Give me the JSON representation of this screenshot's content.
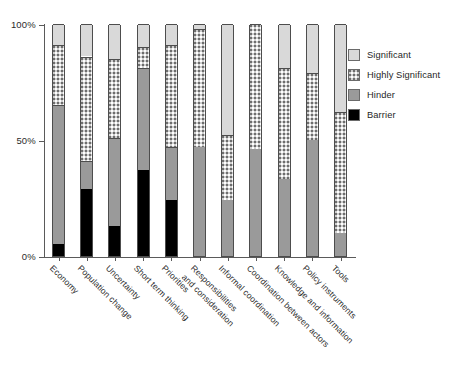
{
  "chart_data": {
    "type": "bar",
    "subtype": "stacked-100-percent",
    "title": "",
    "xlabel": "",
    "ylabel": "",
    "ylim": [
      0,
      100
    ],
    "ytick_labels": [
      "100%",
      "50%",
      "0%"
    ],
    "ytick_values": [
      100,
      50,
      0
    ],
    "grid": false,
    "legend_position": "right",
    "legend": [
      "Significant",
      "Highly Significant",
      "Hinder",
      "Barrier"
    ],
    "stack_order_bottom_to_top": [
      "Barrier",
      "Hinder",
      "Highly Significant",
      "Significant"
    ],
    "categories": [
      "Economy",
      "Population change",
      "Uncertainty",
      "Short term thinking",
      "Priorities",
      "Responsibilities and consideration",
      "Informal coordination",
      "Coordination between actors",
      "Knowledge and information",
      "Policy instruments",
      "Tools"
    ],
    "series": [
      {
        "name": "Barrier",
        "values": [
          5,
          29,
          13,
          37,
          24,
          0,
          0,
          0,
          0,
          0,
          0
        ]
      },
      {
        "name": "Hinder",
        "values": [
          60,
          12,
          38,
          44,
          23,
          47,
          24,
          46,
          33,
          50,
          10
        ]
      },
      {
        "name": "Highly Significant",
        "values": [
          26,
          45,
          34,
          9,
          44,
          51,
          28,
          54,
          48,
          29,
          52
        ]
      },
      {
        "name": "Significant",
        "values": [
          9,
          14,
          15,
          10,
          9,
          2,
          48,
          0,
          19,
          21,
          38
        ]
      }
    ]
  },
  "legend": {
    "items": [
      {
        "label": "Significant",
        "pattern": "solid-light",
        "color": "#d9d9d9"
      },
      {
        "label": "Highly Significant",
        "pattern": "stipple",
        "color": "#cfcfcf"
      },
      {
        "label": "Hinder",
        "pattern": "solid-medium",
        "color": "#9a9a9a"
      },
      {
        "label": "Barrier",
        "pattern": "solid-black",
        "color": "#000000"
      }
    ]
  },
  "axis": {
    "y_labels": [
      "100%",
      "50%",
      "0%"
    ]
  },
  "x_labels": [
    {
      "line1": "Economy",
      "line2": ""
    },
    {
      "line1": "Population change",
      "line2": ""
    },
    {
      "line1": "Uncertainty",
      "line2": ""
    },
    {
      "line1": "Short term thinking",
      "line2": ""
    },
    {
      "line1": "Priorities",
      "line2": ""
    },
    {
      "line1": "Responsibilities",
      "line2": "and consideration"
    },
    {
      "line1": "Informal coordination",
      "line2": ""
    },
    {
      "line1": "Coordination between actors",
      "line2": ""
    },
    {
      "line1": "Knowledge and information",
      "line2": ""
    },
    {
      "line1": "Policy instruments",
      "line2": ""
    },
    {
      "line1": "Tools",
      "line2": ""
    }
  ]
}
